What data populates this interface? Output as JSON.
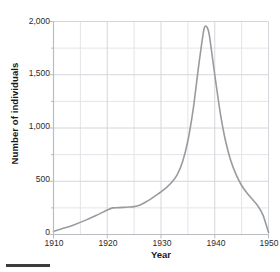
{
  "chart_data": {
    "type": "line",
    "title": "",
    "xlabel": "Year",
    "ylabel": "Number of individuals",
    "xlim": [
      1910,
      1950
    ],
    "ylim": [
      0,
      2000
    ],
    "xticks": [
      1910,
      1920,
      1930,
      1940,
      1950
    ],
    "xtick_labels": [
      "1910",
      "1920",
      "1930",
      "1940",
      "1950"
    ],
    "yticks": [
      0,
      500,
      1000,
      1500,
      2000
    ],
    "ytick_labels": [
      "0",
      "500",
      "1,000",
      "1,500",
      "2,000"
    ],
    "x_minor_step": 5,
    "y_minor_step": 250,
    "grid": true,
    "grid_color": "#d3d6da",
    "axis_color": "#b9bcc0",
    "line_color": "#999b9e",
    "line_width": 1.6,
    "legend": "none",
    "x": [
      1910,
      1912,
      1914,
      1916,
      1918,
      1920,
      1921,
      1922,
      1923,
      1924,
      1925,
      1926,
      1927,
      1928,
      1929,
      1930,
      1931,
      1932,
      1933,
      1934,
      1935,
      1936,
      1937,
      1938,
      1938.5,
      1939,
      1940,
      1941,
      1942,
      1943,
      1944,
      1945,
      1946,
      1947,
      1948,
      1949,
      1950
    ],
    "y": [
      30,
      60,
      95,
      135,
      180,
      230,
      250,
      252,
      255,
      258,
      262,
      275,
      300,
      330,
      365,
      400,
      440,
      490,
      560,
      680,
      880,
      1180,
      1580,
      1930,
      1950,
      1870,
      1500,
      1150,
      880,
      690,
      560,
      460,
      390,
      330,
      270,
      180,
      20
    ],
    "annotations": []
  }
}
